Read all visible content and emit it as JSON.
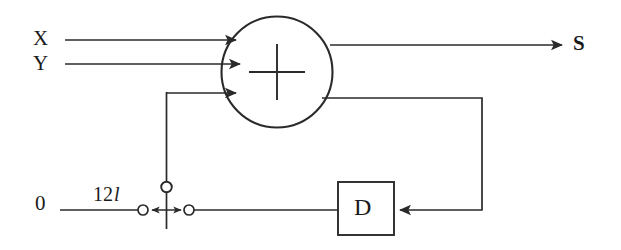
{
  "diagram": {
    "type": "block-diagram",
    "colors": {
      "line": "#2a2a2a",
      "background": "#ffffff",
      "text": "#1a1a1a"
    },
    "labels": {
      "input_x": "X",
      "input_y": "Y",
      "output_s": "S",
      "ground": "0",
      "switch_annotation_number": "12",
      "switch_annotation_symbol": "l",
      "delay_block": "D",
      "adder_symbol": "+"
    },
    "nodes": [
      {
        "name": "adder",
        "label": "+",
        "shape": "circle",
        "cx": 277,
        "cy": 72,
        "r": 55
      },
      {
        "name": "delay",
        "label": "D",
        "shape": "rect",
        "x": 338,
        "y": 182,
        "w": 56,
        "h": 53
      },
      {
        "name": "switch-pivot-terminal",
        "shape": "open-circle",
        "cx": 166,
        "cy": 187,
        "r": 5
      },
      {
        "name": "switch-left-terminal",
        "shape": "open-circle",
        "cx": 143,
        "cy": 210,
        "r": 5
      },
      {
        "name": "switch-right-terminal",
        "shape": "open-circle",
        "cx": 189,
        "cy": 210,
        "r": 5
      }
    ],
    "edges": [
      {
        "name": "x-to-adder",
        "from": "X",
        "to": "adder",
        "arrow": true
      },
      {
        "name": "y-to-adder",
        "from": "Y",
        "to": "adder",
        "arrow": true
      },
      {
        "name": "feedback-to-adder",
        "from": "switch",
        "to": "adder",
        "arrow": true
      },
      {
        "name": "adder-to-s",
        "from": "adder",
        "to": "S",
        "arrow": true
      },
      {
        "name": "adder-to-delay",
        "from": "adder",
        "to": "delay",
        "arrow": true
      },
      {
        "name": "delay-to-switch",
        "from": "delay",
        "to": "switch-right-terminal",
        "arrow": false
      },
      {
        "name": "ground-to-switch",
        "from": "0",
        "to": "switch-left-terminal",
        "arrow": false
      }
    ]
  }
}
